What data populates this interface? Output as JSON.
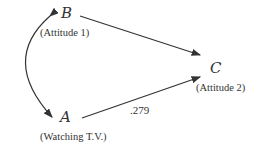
{
  "diagram": {
    "nodes": {
      "B": {
        "symbol": "B",
        "label": "(Attitude 1)"
      },
      "A": {
        "symbol": "A",
        "label": "(Watching T.V.)"
      },
      "C": {
        "symbol": "C",
        "label": "(Attitude 2)"
      }
    },
    "edges": [
      {
        "from": "B",
        "to": "C",
        "coefficient": ""
      },
      {
        "from": "A",
        "to": "C",
        "coefficient": ".279"
      },
      {
        "from": "A",
        "to": "B",
        "type": "bidirectional-curve"
      }
    ],
    "colors": {
      "line": "#333333",
      "text": "#333333"
    }
  }
}
